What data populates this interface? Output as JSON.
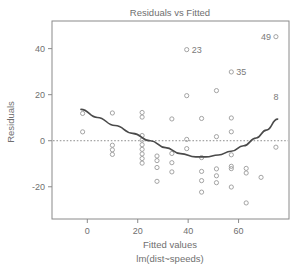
{
  "chart_data": {
    "type": "scatter",
    "title": "Residuals vs Fitted",
    "xlabel": "Fitted values",
    "sublabel": "lm(dist~speeds)",
    "ylabel": "Residuals",
    "xlim": [
      -14,
      80
    ],
    "ylim": [
      -34,
      52
    ],
    "xticks": [
      0,
      20,
      40,
      60
    ],
    "yticks": [
      -20,
      0,
      20,
      40
    ],
    "xtick_labels": [
      "0",
      "20",
      "40",
      "60"
    ],
    "ytick_labels": [
      "-20",
      "0",
      "20",
      "40"
    ],
    "grid": false,
    "legend": null,
    "zero_reference_line": 0,
    "marker": "open-circle",
    "colors": {
      "axis": "#8a8a8a",
      "text": "#6f6f6f",
      "point": "#9a9a9a",
      "smoother": "#4a4a4a",
      "reference": "#8f8f8f",
      "background": "#ffffff"
    },
    "x": [
      -1.85,
      -1.85,
      9.95,
      9.95,
      9.95,
      9.95,
      21.74,
      21.74,
      21.74,
      21.74,
      21.74,
      21.74,
      21.74,
      21.74,
      21.74,
      27.64,
      27.64,
      27.64,
      27.64,
      33.54,
      33.54,
      33.54,
      33.54,
      39.43,
      39.43,
      39.43,
      39.43,
      45.33,
      45.33,
      45.33,
      45.33,
      45.33,
      51.23,
      51.23,
      51.23,
      51.23,
      51.23,
      57.12,
      57.12,
      57.12,
      57.12,
      57.12,
      57.12,
      57.12,
      63.02,
      63.02,
      63.02,
      68.92,
      74.81,
      74.81
    ],
    "y": [
      3.85,
      11.85,
      -5.95,
      -3.95,
      12.05,
      -1.95,
      -7.74,
      -9.74,
      -3.74,
      2.26,
      10.26,
      12.26,
      -1.74,
      -5.74,
      0.26,
      -11.64,
      -17.64,
      -8.64,
      -6.64,
      -13.54,
      -9.54,
      -5.54,
      9.46,
      0.57,
      -3.43,
      19.57,
      39.57,
      -13.33,
      -17.33,
      -7.33,
      9.67,
      -22.33,
      -15.23,
      -18.23,
      1.77,
      -12.23,
      21.77,
      -11.12,
      -12.12,
      -6.12,
      29.88,
      9.88,
      -20.12,
      3.88,
      -12.02,
      -27.02,
      -14.02,
      -15.91,
      -2.81,
      45.19
    ],
    "labeled_points": [
      {
        "label": "49",
        "x": 74.81,
        "y": 45.19,
        "label_side": "left"
      },
      {
        "label": "23",
        "x": 39.43,
        "y": 39.57,
        "label_side": "right"
      },
      {
        "label": "35",
        "x": 57.12,
        "y": 29.88,
        "label_side": "right"
      },
      {
        "label": "8",
        "x": 74.81,
        "y": 19.0,
        "label_side": "center"
      }
    ],
    "smoother_points": [
      {
        "x": -2.5,
        "y": 13.6
      },
      {
        "x": 4.0,
        "y": 10.1
      },
      {
        "x": 11.0,
        "y": 6.6
      },
      {
        "x": 18.0,
        "y": 3.2
      },
      {
        "x": 25.0,
        "y": 0.0
      },
      {
        "x": 31.0,
        "y": -3.0
      },
      {
        "x": 37.0,
        "y": -5.6
      },
      {
        "x": 43.0,
        "y": -7.0
      },
      {
        "x": 47.0,
        "y": -7.0
      },
      {
        "x": 52.0,
        "y": -6.2
      },
      {
        "x": 57.0,
        "y": -4.6
      },
      {
        "x": 62.0,
        "y": -2.2
      },
      {
        "x": 67.0,
        "y": 1.2
      },
      {
        "x": 71.0,
        "y": 4.6
      },
      {
        "x": 75.5,
        "y": 9.4
      }
    ]
  }
}
